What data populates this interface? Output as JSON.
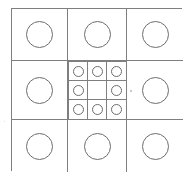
{
  "figure": {
    "name": "nested-grid-circles",
    "colors": {
      "background": "#ffffff",
      "grid_line": "#807f80",
      "circle_stroke": "#6e6d6e",
      "speck": "#b9b8b9"
    },
    "outer_grid": {
      "rows": 3,
      "columns": 3,
      "cells": [
        {
          "row": 1,
          "col": 1,
          "content": "circle",
          "label": "top-left"
        },
        {
          "row": 1,
          "col": 2,
          "content": "circle",
          "label": "top-center"
        },
        {
          "row": 1,
          "col": 3,
          "content": "circle",
          "label": "top-right"
        },
        {
          "row": 2,
          "col": 1,
          "content": "circle",
          "label": "middle-left"
        },
        {
          "row": 2,
          "col": 2,
          "content": "nested-grid",
          "label": "center"
        },
        {
          "row": 2,
          "col": 3,
          "content": "circle",
          "label": "middle-right"
        },
        {
          "row": 3,
          "col": 1,
          "content": "circle",
          "label": "bottom-left"
        },
        {
          "row": 3,
          "col": 2,
          "content": "circle",
          "label": "bottom-center"
        },
        {
          "row": 3,
          "col": 3,
          "content": "circle",
          "label": "bottom-right"
        }
      ]
    },
    "inner_grid": {
      "rows": 3,
      "columns": 3,
      "cells": [
        {
          "row": 1,
          "col": 1,
          "content": "small-circle",
          "label": "inner-top-left"
        },
        {
          "row": 1,
          "col": 2,
          "content": "small-circle",
          "label": "inner-top-center"
        },
        {
          "row": 1,
          "col": 3,
          "content": "small-circle",
          "label": "inner-top-right"
        },
        {
          "row": 2,
          "col": 1,
          "content": "small-circle",
          "label": "inner-middle-left"
        },
        {
          "row": 2,
          "col": 2,
          "content": "empty",
          "label": "inner-center"
        },
        {
          "row": 2,
          "col": 3,
          "content": "small-circle",
          "label": "inner-middle-right"
        },
        {
          "row": 3,
          "col": 1,
          "content": "small-circle",
          "label": "inner-bottom-left"
        },
        {
          "row": 3,
          "col": 2,
          "content": "small-circle",
          "label": "inner-bottom-center"
        },
        {
          "row": 3,
          "col": 3,
          "content": "small-circle",
          "label": "inner-bottom-right"
        }
      ]
    },
    "artifacts": [
      {
        "type": "speck",
        "label": "scan-speck-right-of-center"
      },
      {
        "type": "speck",
        "label": "scan-speck-left-edge"
      }
    ]
  }
}
